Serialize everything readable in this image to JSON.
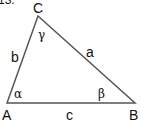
{
  "problem_number": "13.",
  "triangle": {
    "vertices": [
      {
        "name": "A",
        "x": 7,
        "y": 103
      },
      {
        "name": "B",
        "x": 135,
        "y": 103
      },
      {
        "name": "C",
        "x": 38,
        "y": 16
      }
    ],
    "sides": [
      {
        "name": "a",
        "between": "B-C"
      },
      {
        "name": "b",
        "between": "A-C"
      },
      {
        "name": "c",
        "between": "A-B"
      }
    ],
    "angles": [
      {
        "name": "α",
        "vertex": "A"
      },
      {
        "name": "β",
        "vertex": "B"
      },
      {
        "name": "γ",
        "vertex": "C"
      }
    ],
    "stroke_color": "#555555"
  },
  "labels": {
    "A": "A",
    "B": "B",
    "C": "C",
    "a": "a",
    "b": "b",
    "c": "c",
    "alpha": "α",
    "beta": "β",
    "gamma": "γ"
  }
}
